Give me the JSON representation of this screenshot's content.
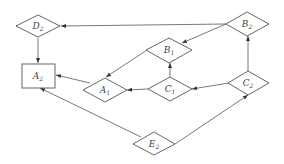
{
  "diagram": {
    "type": "directed-graph",
    "colors": {
      "stroke": "#555555",
      "background": "#ffffff",
      "text": "#444444"
    },
    "nodes": [
      {
        "id": "D2",
        "letter": "D",
        "sub": "2",
        "shape": "diamond",
        "cx": 38,
        "cy": 26
      },
      {
        "id": "B2",
        "letter": "B",
        "sub": "2",
        "shape": "diamond",
        "cx": 247,
        "cy": 24
      },
      {
        "id": "B1",
        "letter": "B",
        "sub": "1",
        "shape": "diamond",
        "cx": 169,
        "cy": 50
      },
      {
        "id": "A2",
        "letter": "A",
        "sub": "2",
        "shape": "rectangle",
        "cx": 38,
        "cy": 76
      },
      {
        "id": "A1",
        "letter": "A",
        "sub": "1",
        "shape": "diamond",
        "cx": 105,
        "cy": 90
      },
      {
        "id": "C1",
        "letter": "C",
        "sub": "1",
        "shape": "diamond",
        "cx": 170,
        "cy": 89
      },
      {
        "id": "C2",
        "letter": "C",
        "sub": "2",
        "shape": "diamond",
        "cx": 248,
        "cy": 83
      },
      {
        "id": "E2",
        "letter": "E",
        "sub": "2",
        "shape": "diamond",
        "cx": 154,
        "cy": 144
      }
    ],
    "edges": [
      {
        "from": "B2",
        "to": "D2"
      },
      {
        "from": "B2",
        "to": "B1"
      },
      {
        "from": "D2",
        "to": "A2"
      },
      {
        "from": "A1",
        "to": "A2"
      },
      {
        "from": "B1",
        "to": "A1"
      },
      {
        "from": "C1",
        "to": "B1"
      },
      {
        "from": "C1",
        "to": "A1"
      },
      {
        "from": "C2",
        "to": "C1"
      },
      {
        "from": "C2",
        "to": "B2"
      },
      {
        "from": "E2",
        "to": "A2"
      },
      {
        "from": "E2",
        "to": "C2"
      }
    ]
  }
}
